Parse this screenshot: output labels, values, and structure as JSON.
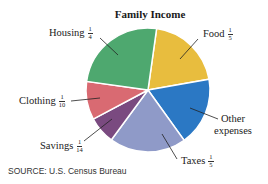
{
  "chart_data": {
    "type": "pie",
    "title": "Family Income",
    "slices": [
      {
        "label": "Food",
        "fraction": "1/5",
        "value": 0.2,
        "color": "#e8bd3e"
      },
      {
        "label": "Other expenses",
        "fraction": "",
        "value": 0.1786,
        "color": "#2b78c4"
      },
      {
        "label": "Taxes",
        "fraction": "1/5",
        "value": 0.2,
        "color": "#8f9ac8"
      },
      {
        "label": "Savings",
        "fraction": "1/14",
        "value": 0.0714,
        "color": "#7a4a80"
      },
      {
        "label": "Clothing",
        "fraction": "1/10",
        "value": 0.1,
        "color": "#d96a72"
      },
      {
        "label": "Housing",
        "fraction": "1/4",
        "value": 0.25,
        "color": "#4ea86f"
      }
    ],
    "source": "SOURCE: U.S. Census Bureau"
  },
  "labels": {
    "title": "Family Income",
    "housing": {
      "name": "Housing",
      "num": "1",
      "den": "4"
    },
    "food": {
      "name": "Food",
      "num": "1",
      "den": "5"
    },
    "clothing": {
      "name": "Clothing",
      "num": "1",
      "den": "10"
    },
    "savings": {
      "name": "Savings",
      "num": "1",
      "den": "14"
    },
    "taxes": {
      "name": "Taxes",
      "num": "1",
      "den": "5"
    },
    "other": {
      "line1": "Other",
      "line2": "expenses"
    },
    "source": "SOURCE: U.S. Census Bureau"
  }
}
